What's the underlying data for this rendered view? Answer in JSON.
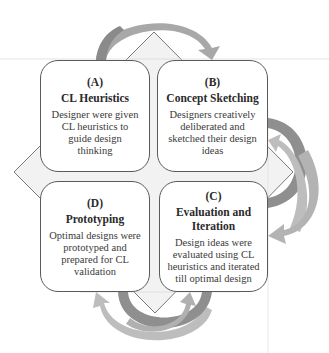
{
  "diagram": {
    "type": "cyclic-process",
    "colors": {
      "box_border": "#5a5a5a",
      "diamond_fill": "#f2f2f2",
      "diamond_stroke": "#7a7a7a",
      "arrow_dark": "#8f8f8f",
      "arrow_light": "#bdbdbd",
      "text": "#2a2a2a"
    },
    "stages": [
      {
        "letter": "(A)",
        "title": "CL Heuristics",
        "description": "Designer were given CL heuristics to guide design thinking"
      },
      {
        "letter": "(B)",
        "title": "Concept Sketching",
        "description": "Designers creatively deliberated and sketched their design ideas"
      },
      {
        "letter": "(C)",
        "title": "Evaluation and Iteration",
        "description": "Design ideas were evaluated using CL heuristics and iterated till optimal design"
      },
      {
        "letter": "(D)",
        "title": "Prototyping",
        "description": "Optimal designs were prototyped and prepared for CL validation"
      }
    ],
    "arrows": [
      {
        "from": "A",
        "to": "B",
        "position": "top",
        "style": "single"
      },
      {
        "from": "B",
        "to": "C",
        "position": "right",
        "style": "double-iterative"
      },
      {
        "from": "C",
        "to": "D",
        "position": "bottom",
        "style": "double-iterative"
      }
    ]
  }
}
